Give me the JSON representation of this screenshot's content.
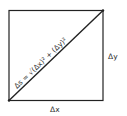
{
  "diagram": {
    "type": "right-triangle-in-square",
    "diagonal_label": "Δs = √(Δx)² + (Δy)²",
    "bottom_label": "Δx",
    "right_label": "Δy",
    "colors": {
      "stroke": "#222222",
      "text": "#333333",
      "background": "#ffffff"
    }
  }
}
